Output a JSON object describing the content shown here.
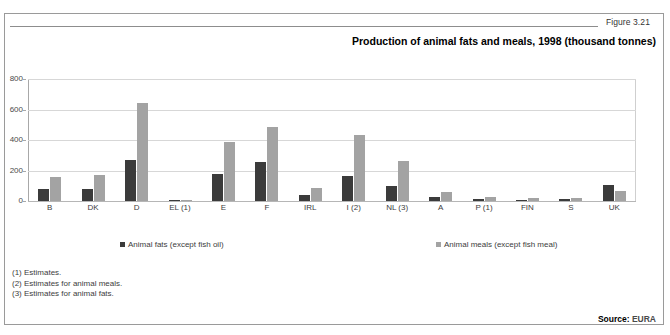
{
  "figure": {
    "number_label": "Figure 3.21",
    "title": "Production of animal fats and meals, 1998 (thousand tonnes)"
  },
  "source": {
    "label": "Source:",
    "value": "EURA"
  },
  "footnotes": [
    "(1) Estimates.",
    "(2) Estimates for animal meals.",
    "(3) Estimates for animal fats."
  ],
  "legend": {
    "fats": {
      "label": "Animal fats (except fish oil)",
      "color": "#3b3b3b"
    },
    "meals": {
      "label": "Animal meals (except fish meal)",
      "color": "#a3a3a3"
    }
  },
  "chart_data": {
    "type": "bar",
    "title": "Production of animal fats and meals, 1998 (thousand tonnes)",
    "xlabel": "",
    "ylabel": "",
    "ylim": [
      0,
      800
    ],
    "yticks": [
      0,
      200,
      400,
      600,
      800
    ],
    "grid": true,
    "legend_position": "bottom",
    "categories": [
      "B",
      "DK",
      "D",
      "EL (1)",
      "E",
      "F",
      "IRL",
      "I (2)",
      "NL (3)",
      "A",
      "P (1)",
      "FIN",
      "S",
      "UK"
    ],
    "series": [
      {
        "name": "Animal fats (except fish oil)",
        "color": "#3b3b3b",
        "values": [
          80,
          80,
          270,
          5,
          175,
          255,
          40,
          165,
          100,
          25,
          15,
          8,
          12,
          105
        ]
      },
      {
        "name": "Animal meals (except fish meal)",
        "color": "#a3a3a3",
        "values": [
          160,
          172,
          645,
          6,
          385,
          485,
          85,
          430,
          265,
          58,
          25,
          18,
          22,
          65
        ]
      }
    ]
  }
}
